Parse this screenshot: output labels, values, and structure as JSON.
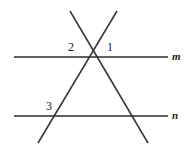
{
  "figure": {
    "background_color": "#ffffff",
    "stroke_color": "#2b2b2b",
    "width": 192,
    "height": 150,
    "lines": [
      {
        "name": "line-m",
        "label": "m",
        "type": "horizontal",
        "x1": 14,
        "y1": 57,
        "x2": 168,
        "y2": 57,
        "label_x": 175,
        "label_y": 57
      },
      {
        "name": "line-n",
        "label": "n",
        "type": "horizontal",
        "x1": 14,
        "y1": 116,
        "x2": 168,
        "y2": 116,
        "label_x": 175,
        "label_y": 116
      },
      {
        "name": "transversal-a",
        "label": "",
        "type": "diagonal-down-right",
        "x1": 70,
        "y1": 11,
        "x2": 148,
        "y2": 143
      },
      {
        "name": "transversal-b",
        "label": "",
        "type": "diagonal-down-left",
        "x1": 117,
        "y1": 11,
        "x2": 38,
        "y2": 143
      }
    ],
    "intersections": [
      {
        "name": "transversals-cross-on-line-m",
        "x": 92,
        "y": 57
      },
      {
        "name": "transversal-b-crosses-line-n",
        "x": 57,
        "y": 116
      },
      {
        "name": "transversal-a-crosses-line-n",
        "x": 128,
        "y": 116
      }
    ],
    "angle_labels": [
      {
        "name": "angle-2",
        "text": "2",
        "x": 72,
        "y": 47
      },
      {
        "name": "angle-1",
        "text": "1",
        "x": 111,
        "y": 47
      },
      {
        "name": "angle-3",
        "text": "3",
        "x": 50,
        "y": 106
      }
    ]
  }
}
